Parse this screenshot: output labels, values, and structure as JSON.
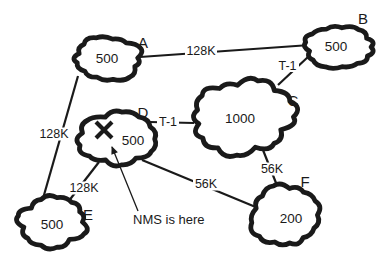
{
  "diagram": {
    "type": "network-topology",
    "colors": {
      "ink": "#1a1a1a",
      "background": "#ffffff"
    },
    "clouds": [
      {
        "name": "A",
        "value": "500"
      },
      {
        "name": "B",
        "value": "500"
      },
      {
        "name": "C",
        "value": "1000"
      },
      {
        "name": "D",
        "value": "500"
      },
      {
        "name": "E",
        "value": "500"
      },
      {
        "name": "F",
        "value": "200"
      }
    ],
    "links": [
      {
        "from": "A",
        "to": "B",
        "label": "128K"
      },
      {
        "from": "A",
        "to": "E",
        "label": "128K"
      },
      {
        "from": "B",
        "to": "C",
        "label": "T-1"
      },
      {
        "from": "D",
        "to": "C",
        "label": "T-1"
      },
      {
        "from": "D",
        "to": "E",
        "label": "128K"
      },
      {
        "from": "D",
        "to": "F",
        "label": "56K"
      },
      {
        "from": "C",
        "to": "F",
        "label": "56K"
      }
    ],
    "annotation": {
      "text": "NMS is here",
      "marker": "X",
      "target_cloud": "D"
    }
  }
}
